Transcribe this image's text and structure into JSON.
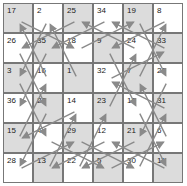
{
  "puzzle": {
    "type": "number-path",
    "rows": 6,
    "cols": 6,
    "colors": {
      "shaded": "#dcdcdc",
      "plain": "#ffffff",
      "arrow": "#8a8a8a",
      "grid": "#777777"
    },
    "cells": [
      [
        "17",
        "2",
        "25",
        "34",
        "19",
        "8"
      ],
      [
        "26",
        "35",
        "18",
        "9",
        "24",
        "33"
      ],
      [
        "3",
        "16",
        "1",
        "32",
        "7",
        "20"
      ],
      [
        "36",
        "27",
        "14",
        "23",
        "10",
        "31"
      ],
      [
        "15",
        "4",
        "29",
        "12",
        "21",
        "6"
      ],
      [
        "28",
        "13",
        "22",
        "5",
        "30",
        "11"
      ]
    ]
  }
}
